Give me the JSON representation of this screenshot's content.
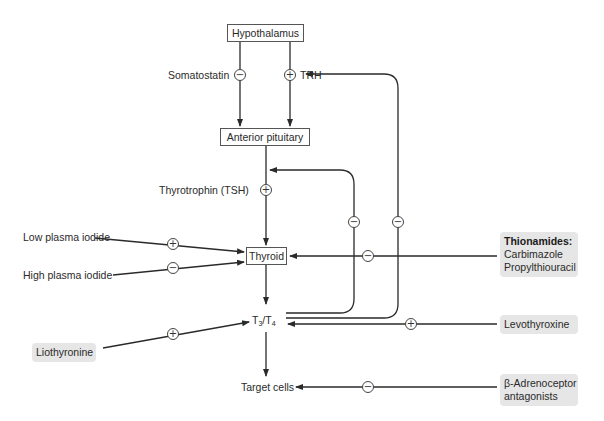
{
  "diagram": {
    "nodes": {
      "hypothalamus": "Hypothalamus",
      "anterior_pituitary": "Anterior pituitary",
      "thyroid": "Thyroid",
      "t3": "T",
      "t3_sub": "3",
      "slash": "/T",
      "t4_sub": "4",
      "target_cells": "Target cells"
    },
    "labels": {
      "somatostatin": "Somatostatin",
      "trh": "TRH",
      "tsh": "Thyrotrophin (TSH)",
      "low_iodide": "Low plasma iodide",
      "high_iodide": "High plasma iodide"
    },
    "drugs": {
      "thionamides_title": "Thionamides:",
      "thionamides_1": "Carbimazole",
      "thionamides_2": "Propylthiouracil",
      "levothyroxine": "Levothyroxine",
      "liothyronine": "Liothyronine",
      "beta_1": "β-Adrenoceptor",
      "beta_2": "antagonists"
    },
    "signs": {
      "plus": "+",
      "minus": "−"
    },
    "colors": {
      "line": "#2a2a2a",
      "drug_bg": "#e6e6e6"
    }
  }
}
